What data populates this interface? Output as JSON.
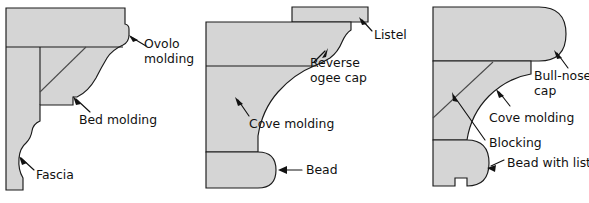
{
  "figure": {
    "background_color": "#ffffff",
    "fill_color": "#d5d5d5",
    "outline_color": "#1a1a1a",
    "text_color": "#111111"
  },
  "panels": [
    {
      "id": "ovolo-assembly",
      "name": "Ovolo molding assembly",
      "labels": [
        {
          "id": "ovolo",
          "line1": "Ovolo",
          "line2": "molding"
        },
        {
          "id": "bed",
          "line1": "Bed molding",
          "line2": ""
        },
        {
          "id": "fascia",
          "line1": "Fascia",
          "line2": ""
        }
      ]
    },
    {
      "id": "ogee-assembly",
      "name": "Reverse ogee cap assembly",
      "labels": [
        {
          "id": "listel",
          "line1": "Listel",
          "line2": ""
        },
        {
          "id": "reverse-ogee",
          "line1": "Reverse",
          "line2": "ogee cap"
        },
        {
          "id": "cove",
          "line1": "Cove molding",
          "line2": ""
        },
        {
          "id": "bead",
          "line1": "Bead",
          "line2": ""
        }
      ]
    },
    {
      "id": "bullnose-assembly",
      "name": "Bull-nose cap assembly",
      "labels": [
        {
          "id": "bullnose",
          "line1": "Bull-nose",
          "line2": "cap"
        },
        {
          "id": "cove",
          "line1": "Cove molding",
          "line2": ""
        },
        {
          "id": "blocking",
          "line1": "Blocking",
          "line2": ""
        },
        {
          "id": "bead-listel",
          "line1": "Bead with listel",
          "line2": ""
        }
      ]
    }
  ]
}
